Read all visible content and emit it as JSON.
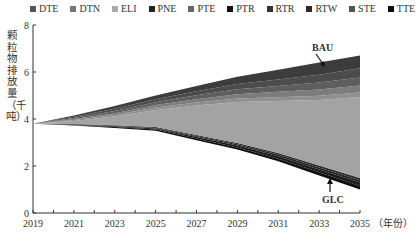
{
  "chart_data": {
    "type": "area",
    "stacked": true,
    "title": "",
    "xlabel": "（年份）",
    "ylabel": "颗粒物排放量（千吨）",
    "ylim": [
      0,
      8
    ],
    "yticks": [
      "0",
      "2",
      "4",
      "6",
      "8"
    ],
    "xticks": [
      "2019",
      "2021",
      "2023",
      "2025",
      "2027",
      "2029",
      "2031",
      "2033",
      "2035"
    ],
    "x": [
      2019,
      2021,
      2023,
      2025,
      2027,
      2029,
      2031,
      2033,
      2035
    ],
    "legend_position": "top",
    "grid": false,
    "baseline_GLC": [
      3.8,
      3.72,
      3.62,
      3.5,
      3.1,
      2.7,
      2.2,
      1.6,
      1.0
    ],
    "series": [
      {
        "name": "DTE",
        "values": [
          0,
          0.02,
          0.04,
          0.06,
          0.08,
          0.1,
          0.12,
          0.14,
          0.15
        ],
        "color": "#1a1a1a"
      },
      {
        "name": "DTN",
        "values": [
          0,
          0.02,
          0.04,
          0.05,
          0.07,
          0.09,
          0.11,
          0.13,
          0.15
        ],
        "color": "#0d0d0d"
      },
      {
        "name": "ELI",
        "values": [
          0,
          0.02,
          0.03,
          0.04,
          0.05,
          0.06,
          0.07,
          0.08,
          0.1
        ],
        "color": "#333333"
      },
      {
        "name": "PNE",
        "values": [
          0,
          0.01,
          0.02,
          0.03,
          0.05,
          0.06,
          0.08,
          0.09,
          0.1
        ],
        "color": "#222222"
      },
      {
        "name": "PTE",
        "values": [
          0,
          0.15,
          0.4,
          0.85,
          1.45,
          1.95,
          2.4,
          2.95,
          3.5
        ],
        "color": "#9a9a9a"
      },
      {
        "name": "PTR",
        "values": [
          0,
          0.04,
          0.07,
          0.12,
          0.14,
          0.16,
          0.18,
          0.19,
          0.2
        ],
        "color": "#6e6e6e"
      },
      {
        "name": "RTR",
        "values": [
          0,
          0.05,
          0.09,
          0.13,
          0.17,
          0.21,
          0.25,
          0.28,
          0.3
        ],
        "color": "#7a7a7a"
      },
      {
        "name": "RTW",
        "values": [
          0,
          0.06,
          0.11,
          0.15,
          0.2,
          0.25,
          0.3,
          0.34,
          0.4
        ],
        "color": "#555555"
      },
      {
        "name": "STE",
        "values": [
          0,
          0.05,
          0.1,
          0.14,
          0.19,
          0.23,
          0.27,
          0.32,
          0.35
        ],
        "color": "#484848"
      },
      {
        "name": "TTE",
        "values": [
          0,
          0.06,
          0.12,
          0.18,
          0.25,
          0.35,
          0.45,
          0.55,
          0.55
        ],
        "color": "#3a3a3a"
      }
    ],
    "top_BAU": [
      3.8,
      4.15,
      4.55,
      5.0,
      5.4,
      5.8,
      6.1,
      6.4,
      6.7
    ],
    "annotations": [
      {
        "text": "BAU",
        "x": 2033.6,
        "y": 6.5,
        "arrow": "down"
      },
      {
        "text": "GLC",
        "x": 2034.3,
        "y": 1.0,
        "arrow": "up"
      }
    ]
  },
  "legend": {
    "items": [
      {
        "label": "DTE",
        "color": "#1a1a1a"
      },
      {
        "label": "DTN",
        "color": "#555555"
      },
      {
        "label": "ELI",
        "color": "#9a9a9a"
      },
      {
        "label": "PNE",
        "color": "#222222"
      },
      {
        "label": "PTE",
        "color": "#6e6e6e"
      },
      {
        "label": "PTR",
        "color": "#111111"
      },
      {
        "label": "RTR",
        "color": "#333333"
      },
      {
        "label": "RTW",
        "color": "#2a2a2a"
      },
      {
        "label": "STE",
        "color": "#484848"
      },
      {
        "label": "TTE",
        "color": "#0d0d0d"
      }
    ]
  },
  "axis": {
    "ylabel": "颗粒物排放量（千吨）",
    "xunit": "（年份）"
  },
  "annotations": {
    "bau": "BAU",
    "glc": "GLC"
  }
}
